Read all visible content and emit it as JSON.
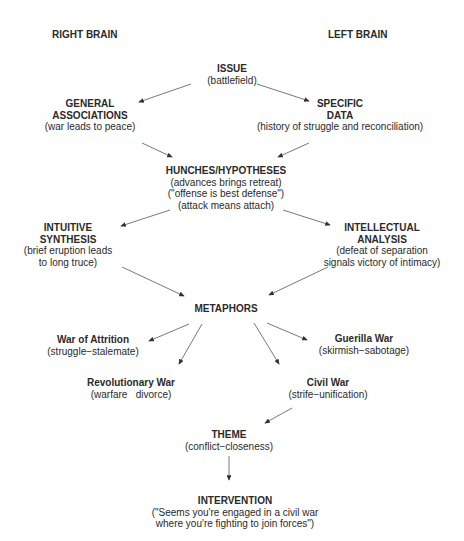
{
  "headers": {
    "right_brain": "RIGHT BRAIN",
    "left_brain": "LEFT BRAIN"
  },
  "nodes": {
    "issue": {
      "title": "ISSUE",
      "lines": [
        "(battlefield)"
      ]
    },
    "general": {
      "title": [
        "GENERAL",
        "ASSOCIATIONS"
      ],
      "lines": [
        "(war leads to peace)"
      ]
    },
    "specific": {
      "title": [
        "SPECIFIC",
        "DATA"
      ],
      "lines": [
        "(history of struggle and reconciliation)"
      ]
    },
    "hunches": {
      "title": "HUNCHES/HYPOTHESES",
      "lines": [
        "(advances brings retreat)",
        "(\"offense is best defense\")",
        "(attack means attach)"
      ]
    },
    "intuitive": {
      "title": [
        "INTUITIVE",
        "SYNTHESIS"
      ],
      "lines": [
        "(brief eruption leads",
        "to long truce)"
      ]
    },
    "intellectual": {
      "title": [
        "INTELLECTUAL",
        "ANALYSIS"
      ],
      "lines": [
        "(defeat of separation",
        "signals victory of intimacy)"
      ]
    },
    "metaphors": {
      "title": "METAPHORS"
    },
    "attrition": {
      "title": "War of Attrition",
      "lines": [
        "(struggle−stalemate)"
      ]
    },
    "guerilla": {
      "title": "Guerilla War",
      "lines": [
        "(skirmish−sabotage)"
      ]
    },
    "revolutionary": {
      "title": "Revolutionary War",
      "lines": [
        "(warfare   divorce)"
      ]
    },
    "civil": {
      "title": "Civil War",
      "lines": [
        "(strife−unification)"
      ]
    },
    "theme": {
      "title": "THEME",
      "lines": [
        "(conflict−closeness)"
      ]
    },
    "intervention": {
      "title": "INTERVENTION",
      "lines": [
        "(\"Seems you're engaged in a civil war",
        "where you're fighting to join forces\")"
      ]
    }
  }
}
